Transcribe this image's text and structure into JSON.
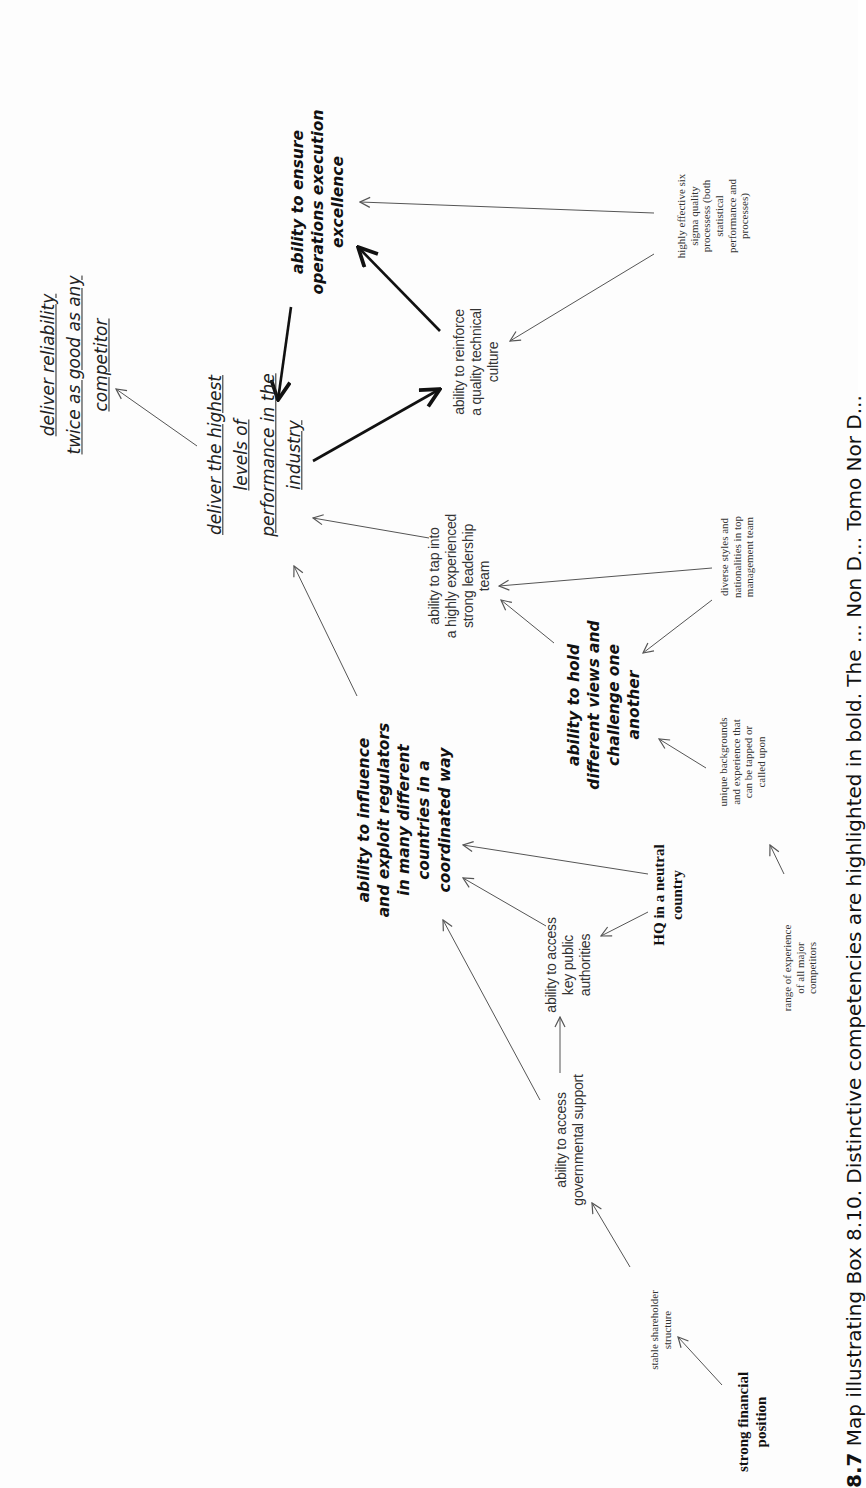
{
  "figure": {
    "orientation": "rotated 90 degrees counter-clockwise",
    "caption_label": "8.7",
    "caption_text": "Map illustrating Box 8.10. Distinctive competencies are highlighted in bold. The ... Non D... Tomo Nor D..."
  },
  "nodes": {
    "deliver_reliability": {
      "lines": [
        "deliver reliability",
        "twice as good as any",
        "competitor"
      ],
      "style": "goal"
    },
    "deliver_highest": {
      "lines": [
        "deliver the highest",
        "levels of",
        "performance in the",
        "industry"
      ],
      "style": "goal"
    },
    "ensure_operations": {
      "lines": [
        "ability to ensure",
        "operations execution",
        "excellence"
      ],
      "style": "distinctive-competency"
    },
    "reinforce_quality": {
      "lines": [
        "ability to reinforce",
        "a quality technical",
        "culture"
      ],
      "style": "competency"
    },
    "six_sigma": {
      "lines": [
        "highly effective six",
        "sigma quality",
        "processess (both",
        "statistical",
        "performance and",
        "processes)"
      ],
      "style": "asset"
    },
    "tap_leadership": {
      "lines": [
        "ability to tap into",
        "a highly experienced",
        "strong leadership",
        "team"
      ],
      "style": "competency"
    },
    "diverse_styles": {
      "lines": [
        "diverse styles and",
        "nationalities in top",
        "management team"
      ],
      "style": "asset"
    },
    "hold_views": {
      "lines": [
        "ability to hold",
        "different views and",
        "challenge one",
        "another"
      ],
      "style": "distinctive-competency"
    },
    "unique_backgrounds": {
      "lines": [
        "unique backgrounds",
        "and experience that",
        "can be tapped or",
        "called upon"
      ],
      "style": "asset"
    },
    "influence_regulators": {
      "lines": [
        "ability to influence",
        "and exploit regulators",
        "in many different",
        "countries in a",
        "coordinated way"
      ],
      "style": "distinctive-competency"
    },
    "hq_neutral": {
      "lines": [
        "HQ in a neutral",
        "country"
      ],
      "style": "bold-asset"
    },
    "key_public": {
      "lines": [
        "ability to access",
        "key public",
        "authorities"
      ],
      "style": "competency"
    },
    "range_experience": {
      "lines": [
        "range of experience",
        "of all major",
        "competitors"
      ],
      "style": "asset"
    },
    "governmental_support": {
      "lines": [
        "ability to access",
        "governmental support"
      ],
      "style": "competency"
    },
    "stable_shareholder": {
      "lines": [
        "stable shareholder",
        "structure"
      ],
      "style": "asset"
    },
    "strong_financial": {
      "lines": [
        "strong financial",
        "position"
      ],
      "style": "bold-asset"
    }
  },
  "edges": [
    {
      "from": "deliver_highest",
      "to": "deliver_reliability",
      "weight": "thin"
    },
    {
      "from": "ensure_operations",
      "to": "deliver_highest",
      "weight": "thick"
    },
    {
      "from": "reinforce_quality",
      "to": "ensure_operations",
      "weight": "thick"
    },
    {
      "from": "deliver_highest",
      "to": "reinforce_quality",
      "weight": "thick"
    },
    {
      "from": "six_sigma",
      "to": "ensure_operations",
      "weight": "thin"
    },
    {
      "from": "six_sigma",
      "to": "reinforce_quality",
      "weight": "thin"
    },
    {
      "from": "tap_leadership",
      "to": "deliver_highest",
      "weight": "thin"
    },
    {
      "from": "diverse_styles",
      "to": "tap_leadership",
      "weight": "thin"
    },
    {
      "from": "diverse_styles",
      "to": "hold_views",
      "weight": "thin"
    },
    {
      "from": "hold_views",
      "to": "tap_leadership",
      "weight": "thin"
    },
    {
      "from": "influence_regulators",
      "to": "deliver_highest",
      "weight": "thin"
    },
    {
      "from": "unique_backgrounds",
      "to": "hold_views",
      "weight": "thin"
    },
    {
      "from": "range_experience",
      "to": "unique_backgrounds",
      "weight": "thin"
    },
    {
      "from": "hq_neutral",
      "to": "influence_regulators",
      "weight": "thin"
    },
    {
      "from": "hq_neutral",
      "to": "key_public",
      "weight": "thin"
    },
    {
      "from": "key_public",
      "to": "influence_regulators",
      "weight": "thin"
    },
    {
      "from": "governmental_support",
      "to": "key_public",
      "weight": "thin"
    },
    {
      "from": "governmental_support",
      "to": "influence_regulators",
      "weight": "thin"
    },
    {
      "from": "stable_shareholder",
      "to": "governmental_support",
      "weight": "thin"
    },
    {
      "from": "strong_financial",
      "to": "stable_shareholder",
      "weight": "thin"
    }
  ],
  "colors": {
    "background": "#fdfdfd",
    "ink": "#222222",
    "thin_edge": "#555555",
    "thick_edge": "#111111"
  }
}
